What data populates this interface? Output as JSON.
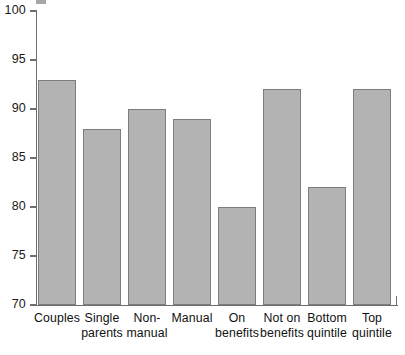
{
  "chart_data": {
    "type": "bar",
    "title": "",
    "xlabel": "",
    "ylabel": "",
    "ylim": [
      70,
      100
    ],
    "yticks": [
      70,
      75,
      80,
      85,
      90,
      95,
      100
    ],
    "grid": false,
    "legend": null,
    "bar_color": "#b3b3b3",
    "bar_edge_color": "#7d7d7d",
    "axis_color": "#6e6e6e",
    "categories": [
      "Couples",
      "Single parents",
      "Non-manual",
      "Manual",
      "On benefits",
      "Not on benefits",
      "Bottom quintile",
      "Top quintile"
    ],
    "category_labels_wrapped": [
      "Couples",
      "Single\nparents",
      "Non-\nmanual",
      "Manual",
      "On\nbenefits",
      "Not on\nbenefits",
      "Bottom\nquintile",
      "Top\nquintile"
    ],
    "values": [
      93,
      88,
      90,
      89,
      80,
      92,
      82,
      92
    ]
  }
}
